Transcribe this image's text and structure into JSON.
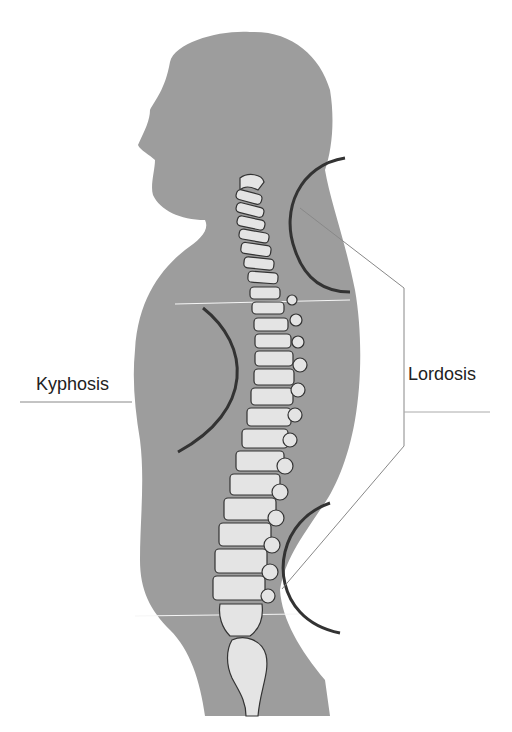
{
  "diagram": {
    "labels": {
      "kyphosis": "Kyphosis",
      "lordosis": "Lordosis"
    },
    "colors": {
      "silhouette": "#9e9e9e",
      "vertebra": "#e6e6e6",
      "outline": "#333333",
      "leader_line": "#8a8a8a",
      "background": "#ffffff"
    }
  }
}
